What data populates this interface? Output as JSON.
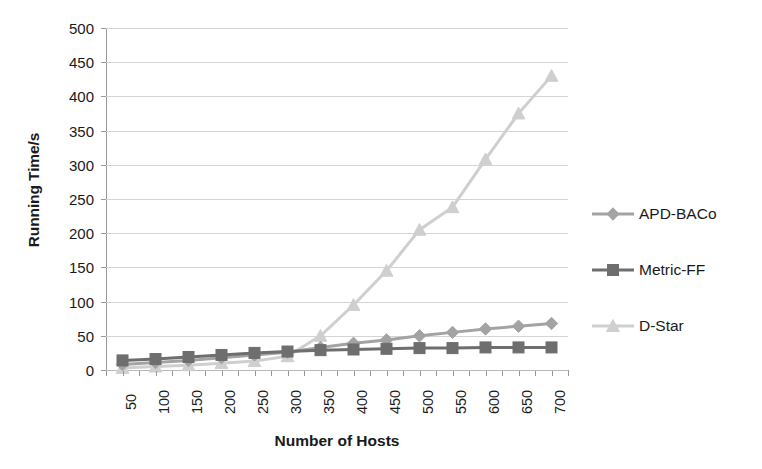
{
  "chart_data": {
    "type": "line",
    "title": "",
    "xlabel": "Number of Hosts",
    "ylabel": "Running Time/s",
    "categories": [
      50,
      100,
      150,
      200,
      250,
      300,
      350,
      400,
      450,
      500,
      550,
      600,
      650,
      700
    ],
    "x_tick_labels": [
      "50",
      "100",
      "150",
      "200",
      "250",
      "300",
      "350",
      "400",
      "450",
      "500",
      "550",
      "600",
      "650",
      "700"
    ],
    "y_tick_labels": [
      "0",
      "50",
      "100",
      "150",
      "200",
      "250",
      "300",
      "350",
      "400",
      "450",
      "500"
    ],
    "y_ticks": [
      0,
      50,
      100,
      150,
      200,
      250,
      300,
      350,
      400,
      450,
      500
    ],
    "ylim": [
      0,
      500
    ],
    "grid": "horizontal",
    "legend_position": "right",
    "series": [
      {
        "name": "APD-BACo",
        "marker": "diamond",
        "color": "#a3a3a3",
        "values": [
          8,
          11,
          14,
          18,
          22,
          26,
          33,
          39,
          44,
          50,
          55,
          60,
          64,
          68
        ]
      },
      {
        "name": "Metric-FF",
        "marker": "square",
        "color": "#6e6e6e",
        "values": [
          14,
          16,
          19,
          22,
          25,
          27,
          29,
          30,
          31,
          32,
          32,
          33,
          33,
          33
        ]
      },
      {
        "name": "D-Star",
        "marker": "triangle",
        "color": "#cfcfcf",
        "values": [
          3,
          5,
          7,
          10,
          13,
          20,
          50,
          95,
          145,
          205,
          238,
          308,
          375,
          430
        ]
      }
    ]
  },
  "legend": {
    "items": [
      {
        "label": "APD-BACo",
        "marker": "diamond",
        "color": "#a3a3a3"
      },
      {
        "label": "Metric-FF",
        "marker": "square",
        "color": "#6e6e6e"
      },
      {
        "label": "D-Star",
        "marker": "triangle",
        "color": "#cfcfcf"
      }
    ]
  }
}
